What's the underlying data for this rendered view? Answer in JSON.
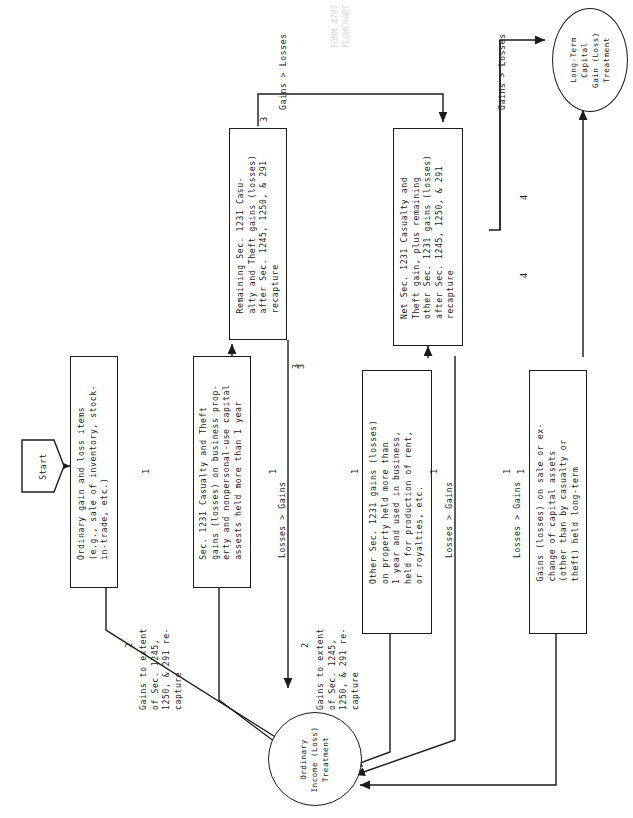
{
  "diagram": {
    "title_hidden_watermark": "FORM 4797\nFLOWCHART",
    "orientation": "rotated-90-ccw"
  },
  "start": {
    "label": "Start",
    "step": "1"
  },
  "nodes": [
    {
      "id": "ordinary-items",
      "step": "1",
      "text": "Ordinary gain and loss items\n(e.g., sale of inventory, stock-\nin-trade, etc.)"
    },
    {
      "id": "sec1231-casualty-theft",
      "step": "1",
      "text": "Sec. 1231 Casualty and Theft\ngains (losses) on business prop-\nerty and nonpersonal-use capital\nassests held more than 1 year"
    },
    {
      "id": "remaining-sec1231-casualty-theft",
      "step": "3",
      "text": "Remaining Sec. 1231 Casu-\nalty and Theft gains (losses)\nafter Sec. 1245, 1250, & 291\nrecapture"
    },
    {
      "id": "net-sec1231-casualty-theft",
      "step": "",
      "text": "Net Sec. 1231 Casualty and\nTheft gain, plus remaining\nother Sec. 1231 gains (losses)\nafter Sec. 1245, 1250, & 291\nrecapture"
    },
    {
      "id": "other-sec1231-gains",
      "step": "1",
      "text": "Other Sec. 1231 gains (losses)\non property held more than\n1 year and used in business,\nheld for production of rent,\nor royalties, etc."
    },
    {
      "id": "capital-assets",
      "step": "1",
      "text": "Gains (losses) on sale or ex-\nchange of capital assets\n(other than by casualty or\ntheft) held long-term"
    }
  ],
  "terminals": [
    {
      "id": "ordinary-income-treatment",
      "text": "Ordinary\nIncome (Loss)\nTreatment"
    },
    {
      "id": "long-term-capital-gain-treatment",
      "text": "Long-Term\nCapital\nGain (Loss)\nTreatment"
    }
  ],
  "edge_labels": [
    {
      "id": "recapture-label-left",
      "text": "Gains to extent\nof Sec. 1245,\n1250, & 291 re-\ncapture",
      "step": "2"
    },
    {
      "id": "recapture-label-right",
      "text": "Gains to extent\nof Sec. 1245,\n1250, & 291 re-\ncapture",
      "step": "2"
    },
    {
      "id": "losses-gt-gains-casualty",
      "text": "Losses > Gains",
      "step": "3"
    },
    {
      "id": "losses-gt-gains-other",
      "text": "Losses > Gains",
      "step": "1"
    },
    {
      "id": "losses-gt-gains-capital",
      "text": "Losses > Gains",
      "step": "1"
    },
    {
      "id": "gains-gt-losses-casualty",
      "text": "Gains > Losses",
      "step": "3"
    },
    {
      "id": "gains-gt-losses-net",
      "text": "Gains > Losses",
      "step": "4"
    }
  ],
  "step_markers": [
    "1",
    "1",
    "2",
    "1",
    "2",
    "3",
    "3",
    "4",
    "4",
    "1",
    "1"
  ],
  "colors": {
    "ink": "#1b1b1b",
    "paper": "#ffffff",
    "watermark": "#d8d8d8"
  }
}
